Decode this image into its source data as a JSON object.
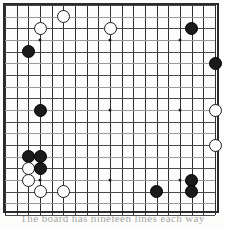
{
  "diagram": {
    "type": "go-board",
    "board_size": 19,
    "colors": {
      "line": "#4a4a4a",
      "border": "#2b2b2b",
      "black_stone": "#1a1a1a",
      "white_stone": "#fcfcfc",
      "white_stone_outline": "#1c1c1c",
      "background": "#fdfdfd"
    },
    "geometry": {
      "origin_x": 5,
      "origin_y": 5,
      "spacing": 11.67,
      "stone_diameter": 13,
      "star_points": [
        [
          3,
          3
        ],
        [
          9,
          3
        ],
        [
          15,
          3
        ],
        [
          3,
          9
        ],
        [
          9,
          9
        ],
        [
          15,
          9
        ],
        [
          3,
          15
        ],
        [
          9,
          15
        ],
        [
          15,
          15
        ]
      ]
    },
    "stones": [
      {
        "color": "white",
        "col": 5,
        "row": 1,
        "label": "F18"
      },
      {
        "color": "white",
        "col": 3,
        "row": 2,
        "label": "D17"
      },
      {
        "color": "white",
        "col": 9,
        "row": 2,
        "label": "K17"
      },
      {
        "color": "black",
        "col": 16,
        "row": 2,
        "label": "R17"
      },
      {
        "color": "black",
        "col": 2,
        "row": 4,
        "label": "C15"
      },
      {
        "color": "black",
        "col": 18,
        "row": 5,
        "label": "T14"
      },
      {
        "color": "black",
        "col": 3,
        "row": 9,
        "label": "D10"
      },
      {
        "color": "white",
        "col": 18,
        "row": 9,
        "label": "T10"
      },
      {
        "color": "white",
        "col": 18,
        "row": 12,
        "label": "T7"
      },
      {
        "color": "black",
        "col": 2,
        "row": 13,
        "label": "C6"
      },
      {
        "color": "black",
        "col": 3,
        "row": 13,
        "label": "D6"
      },
      {
        "color": "white",
        "col": 2,
        "row": 14,
        "label": "C5"
      },
      {
        "color": "black",
        "col": 3,
        "row": 14,
        "label": "D5"
      },
      {
        "color": "white",
        "col": 2,
        "row": 15,
        "label": "C4"
      },
      {
        "color": "white",
        "col": 3,
        "row": 16,
        "label": "D3"
      },
      {
        "color": "white",
        "col": 5,
        "row": 16,
        "label": "F3"
      },
      {
        "color": "black",
        "col": 16,
        "row": 15,
        "label": "R4"
      },
      {
        "color": "black",
        "col": 13,
        "row": 16,
        "label": "N3"
      },
      {
        "color": "black",
        "col": 16,
        "row": 16,
        "label": "R3"
      }
    ],
    "caption": "The board has nineteen lines each way"
  }
}
